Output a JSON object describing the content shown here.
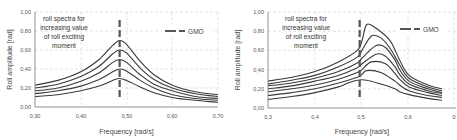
{
  "chart_data": [
    {
      "type": "line",
      "title": "",
      "xlabel": "Frequency  [rad/s]",
      "ylabel": "Roll amplitude [rad]",
      "xlim": [
        0.3,
        0.7
      ],
      "ylim": [
        0.0,
        1.0
      ],
      "xticks": [
        "0,30",
        "0,40",
        "0,50",
        "0,60",
        "0,70"
      ],
      "yticks": [
        "0,00",
        "0,20",
        "0,40",
        "0,60",
        "0,80",
        "1,00"
      ],
      "grid": "dashed",
      "annotation": [
        "roll spectra for",
        "increasing value",
        "of roll exciting",
        "moment"
      ],
      "legend": [
        {
          "name": "GMO",
          "style": "dashed",
          "x": 0.485
        }
      ],
      "legend_position": "upper right",
      "series": [
        {
          "name": "spectrum 1",
          "x": [
            0.3,
            0.35,
            0.4,
            0.44,
            0.47,
            0.485,
            0.5,
            0.53,
            0.56,
            0.6,
            0.65,
            0.7
          ],
          "y": [
            0.23,
            0.28,
            0.37,
            0.5,
            0.65,
            0.7,
            0.66,
            0.48,
            0.34,
            0.23,
            0.16,
            0.13
          ]
        },
        {
          "name": "spectrum 2",
          "x": [
            0.3,
            0.35,
            0.4,
            0.44,
            0.47,
            0.485,
            0.5,
            0.53,
            0.56,
            0.6,
            0.65,
            0.7
          ],
          "y": [
            0.2,
            0.24,
            0.32,
            0.43,
            0.56,
            0.6,
            0.57,
            0.41,
            0.29,
            0.2,
            0.14,
            0.11
          ]
        },
        {
          "name": "spectrum 3",
          "x": [
            0.3,
            0.35,
            0.4,
            0.44,
            0.47,
            0.485,
            0.5,
            0.53,
            0.56,
            0.6,
            0.65,
            0.7
          ],
          "y": [
            0.17,
            0.2,
            0.27,
            0.36,
            0.47,
            0.5,
            0.47,
            0.34,
            0.24,
            0.17,
            0.11,
            0.09
          ]
        },
        {
          "name": "spectrum 4",
          "x": [
            0.3,
            0.35,
            0.4,
            0.44,
            0.47,
            0.485,
            0.5,
            0.53,
            0.56,
            0.6,
            0.65,
            0.7
          ],
          "y": [
            0.14,
            0.17,
            0.22,
            0.29,
            0.37,
            0.4,
            0.38,
            0.28,
            0.2,
            0.13,
            0.09,
            0.07
          ]
        },
        {
          "name": "spectrum 5",
          "x": [
            0.3,
            0.35,
            0.4,
            0.44,
            0.47,
            0.485,
            0.5,
            0.53,
            0.56,
            0.6,
            0.65,
            0.7
          ],
          "y": [
            0.11,
            0.13,
            0.17,
            0.22,
            0.28,
            0.3,
            0.28,
            0.21,
            0.15,
            0.1,
            0.07,
            0.05
          ]
        }
      ]
    },
    {
      "type": "line",
      "title": "",
      "xlabel": "Frequency  [rad/s]",
      "ylabel": "Roll amplitude [rad]",
      "xlim": [
        0.3,
        0.7
      ],
      "ylim": [
        0.0,
        1.0
      ],
      "xticks": [
        "0,3",
        "0,4",
        "0,5",
        "0,6",
        "0"
      ],
      "yticks": [
        "0,00",
        "0,20",
        "0,40",
        "0,60",
        "0,80",
        "1,00"
      ],
      "grid": "dashed",
      "annotation": [
        "roll spectra for",
        "increasing value",
        "of roll exciting",
        "moment"
      ],
      "legend": [
        {
          "name": "GMO",
          "style": "dashed",
          "x": 0.495
        }
      ],
      "legend_position": "upper right",
      "series": [
        {
          "name": "spectrum 1",
          "x": [
            0.3,
            0.35,
            0.4,
            0.45,
            0.49,
            0.5,
            0.51,
            0.53,
            0.56,
            0.58,
            0.6,
            0.64,
            0.67
          ],
          "y": [
            0.28,
            0.32,
            0.38,
            0.48,
            0.6,
            0.7,
            0.87,
            0.83,
            0.7,
            0.5,
            0.34,
            0.24,
            0.2
          ]
        },
        {
          "name": "spectrum 2",
          "x": [
            0.3,
            0.35,
            0.4,
            0.45,
            0.49,
            0.5,
            0.52,
            0.54,
            0.56,
            0.58,
            0.6,
            0.64,
            0.67
          ],
          "y": [
            0.25,
            0.29,
            0.34,
            0.43,
            0.53,
            0.6,
            0.75,
            0.73,
            0.62,
            0.45,
            0.31,
            0.22,
            0.18
          ]
        },
        {
          "name": "spectrum 3",
          "x": [
            0.3,
            0.35,
            0.4,
            0.45,
            0.49,
            0.5,
            0.53,
            0.55,
            0.57,
            0.58,
            0.6,
            0.64,
            0.67
          ],
          "y": [
            0.23,
            0.26,
            0.31,
            0.38,
            0.47,
            0.52,
            0.65,
            0.63,
            0.5,
            0.4,
            0.28,
            0.2,
            0.16
          ]
        },
        {
          "name": "spectrum 4",
          "x": [
            0.3,
            0.35,
            0.4,
            0.45,
            0.49,
            0.5,
            0.53,
            0.55,
            0.57,
            0.58,
            0.6,
            0.64,
            0.67
          ],
          "y": [
            0.2,
            0.23,
            0.28,
            0.34,
            0.42,
            0.46,
            0.56,
            0.54,
            0.43,
            0.35,
            0.25,
            0.18,
            0.15
          ]
        },
        {
          "name": "spectrum 5",
          "x": [
            0.3,
            0.35,
            0.4,
            0.45,
            0.49,
            0.5,
            0.52,
            0.55,
            0.57,
            0.58,
            0.6,
            0.64,
            0.67
          ],
          "y": [
            0.17,
            0.2,
            0.24,
            0.3,
            0.37,
            0.4,
            0.48,
            0.46,
            0.36,
            0.3,
            0.22,
            0.16,
            0.13
          ]
        },
        {
          "name": "spectrum 6",
          "x": [
            0.3,
            0.35,
            0.4,
            0.45,
            0.49,
            0.5,
            0.51,
            0.54,
            0.57,
            0.58,
            0.6,
            0.64,
            0.67
          ],
          "y": [
            0.13,
            0.16,
            0.2,
            0.26,
            0.32,
            0.35,
            0.39,
            0.37,
            0.28,
            0.24,
            0.18,
            0.13,
            0.11
          ]
        },
        {
          "name": "spectrum 7",
          "x": [
            0.3,
            0.35,
            0.4,
            0.45,
            0.47,
            0.49,
            0.51,
            0.54,
            0.57,
            0.58,
            0.6,
            0.64,
            0.67
          ],
          "y": [
            0.09,
            0.12,
            0.16,
            0.22,
            0.26,
            0.29,
            0.29,
            0.25,
            0.2,
            0.17,
            0.14,
            0.1,
            0.08
          ]
        }
      ]
    }
  ]
}
